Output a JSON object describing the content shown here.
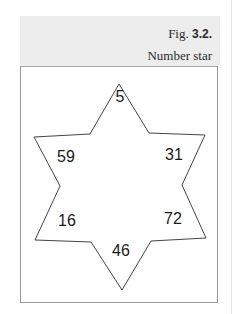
{
  "figure": {
    "prefix": "Fig.",
    "number": "3.2.",
    "title": "Number star"
  },
  "star": {
    "shape": "six-pointed-star",
    "stroke_color": "#444444",
    "numbers": {
      "top": "5",
      "upper_left": "59",
      "upper_right": "31",
      "lower_left": "16",
      "lower_right": "72",
      "bottom": "46"
    }
  },
  "colors": {
    "header_bg": "#ededed",
    "box_border": "#9a9a9a",
    "text": "#1a1a1a"
  }
}
